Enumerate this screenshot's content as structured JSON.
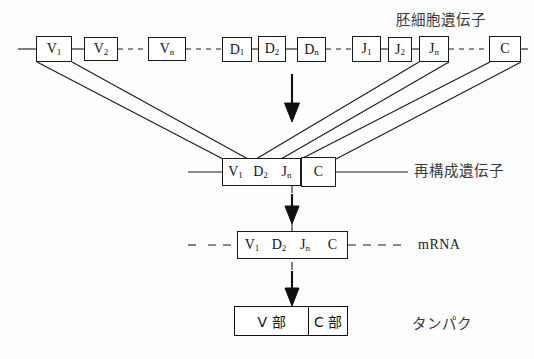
{
  "diagram": {
    "title_visible": false,
    "rows": {
      "germline": {
        "label": "胚細胞遺伝子",
        "segments": [
          {
            "name": "V1",
            "base": "V",
            "sub": "1"
          },
          {
            "name": "V2",
            "base": "V",
            "sub": "2"
          },
          {
            "name": "Vn",
            "base": "V",
            "sub": "n"
          },
          {
            "name": "D1",
            "base": "D",
            "sub": "1"
          },
          {
            "name": "D2",
            "base": "D",
            "sub": "2"
          },
          {
            "name": "Dn",
            "base": "D",
            "sub": "n"
          },
          {
            "name": "J1",
            "base": "J",
            "sub": "1"
          },
          {
            "name": "J2",
            "base": "J",
            "sub": "2"
          },
          {
            "name": "Jn",
            "base": "J",
            "sub": "n"
          },
          {
            "name": "C",
            "base": "C",
            "sub": ""
          }
        ]
      },
      "rearranged": {
        "label": "再構成遺伝子",
        "segments": [
          {
            "name": "V1",
            "base": "V",
            "sub": "1"
          },
          {
            "name": "D2",
            "base": "D",
            "sub": "2"
          },
          {
            "name": "Jn",
            "base": "J",
            "sub": "n"
          },
          {
            "name": "C",
            "base": "C",
            "sub": ""
          }
        ]
      },
      "mrna": {
        "label": "mRNA",
        "segments": [
          {
            "name": "V1",
            "base": "V",
            "sub": "1"
          },
          {
            "name": "D2",
            "base": "D",
            "sub": "2"
          },
          {
            "name": "Jn",
            "base": "J",
            "sub": "n"
          },
          {
            "name": "C",
            "base": "C",
            "sub": ""
          }
        ]
      },
      "protein": {
        "label": "タンパク",
        "segments": [
          {
            "name": "V-region",
            "text": "V 部"
          },
          {
            "name": "C-region",
            "text": "C 部"
          }
        ]
      }
    },
    "colors": {
      "stroke": "#1a1a1a",
      "background": "#fdfdfd",
      "text": "#141414",
      "label_text": "#3a3a3a"
    }
  }
}
